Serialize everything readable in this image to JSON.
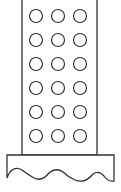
{
  "diagram": {
    "stroke_color": "#333333",
    "fill_color": "#ffffff",
    "tower": {
      "x": 22,
      "y": -2,
      "width": 75,
      "height": 157
    },
    "windows": {
      "rows": 6,
      "cols": 3,
      "cx": [
        36,
        58,
        80
      ],
      "cy_start": 16,
      "cy_step": 24,
      "r": 6.5
    },
    "base": {
      "x": 7,
      "y": 155,
      "width": 107
    }
  }
}
